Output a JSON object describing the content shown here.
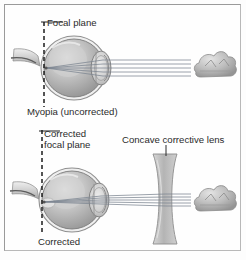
{
  "figure": {
    "border_color": "#9a9a9a",
    "background_color": "#fefefe",
    "width": 246,
    "height": 260
  },
  "labels": {
    "focal_plane": "Focal plane",
    "myopia_uncorrected": "Myopia (uncorrected)",
    "corrected_focal_plane_line1": "Corrected",
    "corrected_focal_plane_line2": "focal plane",
    "concave_corrective_lens": "Concave corrective lens",
    "corrected": "Corrected"
  },
  "panels": [
    {
      "name": "uncorrected",
      "caption": "Myopia (uncorrected)",
      "focal_plane_label": "Focal plane",
      "has_corrective_lens": false,
      "ray_count": 5,
      "description": "Parallel light rays from a distant object enter the eye and converge at a focal plane in front of the retina."
    },
    {
      "name": "corrected",
      "caption": "Corrected",
      "focal_plane_label": "Corrected focal plane",
      "has_corrective_lens": true,
      "lens_type": "concave",
      "lens_label": "Concave corrective lens",
      "ray_count": 5,
      "description": "A concave lens diverges the incoming rays so that they focus on the retina."
    }
  ],
  "colors": {
    "ink": "#2b2b2b",
    "dashed_line": "#1c1c1c",
    "ray": "#7b8490",
    "eye_outline": "#6e6e6e",
    "eye_fill": "#b6b6b6",
    "eye_highlight": "#e2e2e2",
    "lens_fill": "#c9c9c9",
    "cloud_fill": "#c2c2c2",
    "corrective_lens_fill": "#c6c6c6"
  }
}
